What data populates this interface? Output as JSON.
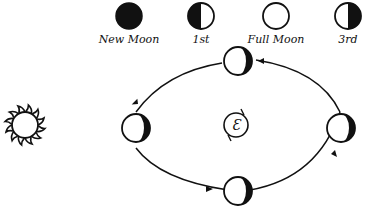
{
  "legend": {
    "items": [
      {
        "phase": "new",
        "label": "New Moon",
        "icon": "new-moon-icon"
      },
      {
        "phase": "first_quarter",
        "label": "1st",
        "icon": "first-quarter-icon"
      },
      {
        "phase": "full",
        "label": "Full Moon",
        "icon": "full-moon-icon"
      },
      {
        "phase": "third_quarter",
        "label": "3rd",
        "icon": "third-quarter-icon"
      }
    ]
  },
  "diagram": {
    "sun": {
      "icon": "sun-icon"
    },
    "earth": {
      "symbol": "Ɛ",
      "icon": "earth-icon"
    },
    "orbit": {
      "direction": "counter-clockwise",
      "moons": 4
    },
    "colors": {
      "ink": "#111111",
      "background": "#ffffff"
    }
  }
}
